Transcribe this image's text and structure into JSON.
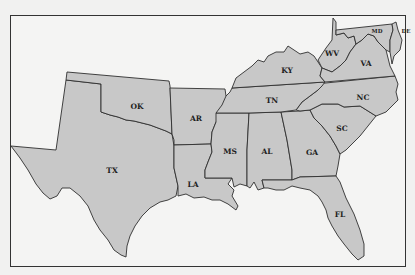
{
  "map": {
    "title": "Southern United States",
    "fill_color": "#c8c8c8",
    "border_color": "#2f2f2f",
    "background_color": "#f1f1f0",
    "states": [
      {
        "abbr": "TX",
        "label": "TX"
      },
      {
        "abbr": "OK",
        "label": "OK"
      },
      {
        "abbr": "AR",
        "label": "AR"
      },
      {
        "abbr": "LA",
        "label": "LA"
      },
      {
        "abbr": "MS",
        "label": "MS"
      },
      {
        "abbr": "AL",
        "label": "AL"
      },
      {
        "abbr": "GA",
        "label": "GA"
      },
      {
        "abbr": "FL",
        "label": "FL"
      },
      {
        "abbr": "SC",
        "label": "SC"
      },
      {
        "abbr": "NC",
        "label": "NC"
      },
      {
        "abbr": "TN",
        "label": "TN"
      },
      {
        "abbr": "KY",
        "label": "KY"
      },
      {
        "abbr": "WV",
        "label": "WV"
      },
      {
        "abbr": "VA",
        "label": "VA"
      },
      {
        "abbr": "MD",
        "label": "MD"
      },
      {
        "abbr": "DE",
        "label": "DE"
      }
    ]
  }
}
